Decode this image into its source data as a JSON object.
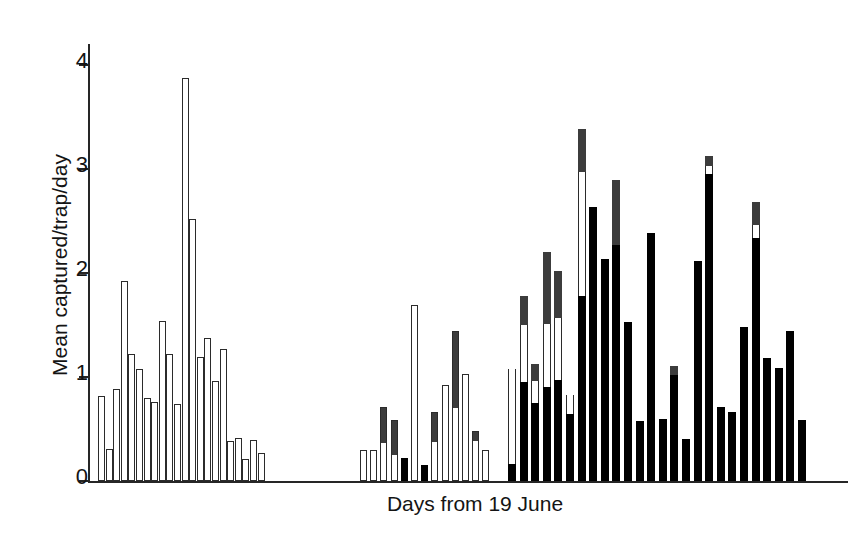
{
  "chart_data": {
    "type": "bar",
    "title": "",
    "subtitle": "",
    "xlabel": "Days from 19 June",
    "ylabel": "Mean captured/trap/day",
    "ylim": [
      0,
      4.2
    ],
    "yticks": [
      0,
      1,
      2,
      3,
      4
    ],
    "ytick_labels": [
      "0",
      "1",
      "2",
      "3",
      "4"
    ],
    "grid": false,
    "legend_position": "none",
    "stacked": true,
    "annotations": [],
    "segment_names": [
      "black",
      "white",
      "gray"
    ],
    "segment_colors": {
      "black": "#000000",
      "white": "#ffffff",
      "gray": "#3c3c3c",
      "outline": "#2b2b2b",
      "axis": "#262626",
      "text": "#141414"
    },
    "groups": [
      {
        "name": "group-1",
        "x_start_px": 98,
        "bar_width_px": 7,
        "bar_pitch_px": 7.6,
        "bars": [
          {
            "black": 0,
            "white": 0.82,
            "gray": 0
          },
          {
            "black": 0,
            "white": 0.31,
            "gray": 0
          },
          {
            "black": 0,
            "white": 0.88,
            "gray": 0
          },
          {
            "black": 0,
            "white": 1.92,
            "gray": 0
          },
          {
            "black": 0,
            "white": 1.22,
            "gray": 0
          },
          {
            "black": 0,
            "white": 1.08,
            "gray": 0
          },
          {
            "black": 0,
            "white": 0.8,
            "gray": 0
          },
          {
            "black": 0,
            "white": 0.76,
            "gray": 0
          },
          {
            "black": 0,
            "white": 1.54,
            "gray": 0
          },
          {
            "black": 0,
            "white": 1.22,
            "gray": 0
          },
          {
            "black": 0,
            "white": 0.74,
            "gray": 0
          },
          {
            "black": 0,
            "white": 3.87,
            "gray": 0
          },
          {
            "black": 0,
            "white": 2.52,
            "gray": 0
          },
          {
            "black": 0,
            "white": 1.19,
            "gray": 0
          },
          {
            "black": 0,
            "white": 1.37,
            "gray": 0
          },
          {
            "black": 0,
            "white": 0.96,
            "gray": 0
          },
          {
            "black": 0,
            "white": 1.27,
            "gray": 0
          },
          {
            "black": 0,
            "white": 0.38,
            "gray": 0
          },
          {
            "black": 0,
            "white": 0.41,
            "gray": 0
          },
          {
            "black": 0,
            "white": 0.21,
            "gray": 0
          },
          {
            "black": 0,
            "white": 0.39,
            "gray": 0
          },
          {
            "black": 0,
            "white": 0.27,
            "gray": 0
          }
        ]
      },
      {
        "name": "group-2",
        "x_start_px": 360,
        "bar_width_px": 7,
        "bar_pitch_px": 10.2,
        "bars": [
          {
            "black": 0,
            "white": 0.3,
            "gray": 0
          },
          {
            "black": 0,
            "white": 0.3,
            "gray": 0
          },
          {
            "black": 0,
            "white": 0.37,
            "gray": 0.34
          },
          {
            "black": 0,
            "white": 0.25,
            "gray": 0.34
          },
          {
            "black": 0.22,
            "white": 0,
            "gray": 0
          },
          {
            "black": 0,
            "white": 1.69,
            "gray": 0
          },
          {
            "black": 0.15,
            "white": 0,
            "gray": 0
          },
          {
            "black": 0,
            "white": 0.38,
            "gray": 0.28
          },
          {
            "black": 0,
            "white": 0.92,
            "gray": 0
          },
          {
            "black": 0,
            "white": 0.7,
            "gray": 0.74
          },
          {
            "black": 0,
            "white": 1.03,
            "gray": 0
          },
          {
            "black": 0,
            "white": 0.39,
            "gray": 0.09
          },
          {
            "black": 0,
            "white": 0.3,
            "gray": 0
          }
        ]
      },
      {
        "name": "group-3",
        "x_start_px": 508,
        "bar_width_px": 8,
        "bar_pitch_px": 11.6,
        "bars": [
          {
            "black": 0.16,
            "white": 0.92,
            "gray": 0
          },
          {
            "black": 0.95,
            "white": 0.55,
            "gray": 0.28
          },
          {
            "black": 0.75,
            "white": 0.21,
            "gray": 0.16
          },
          {
            "black": 0.9,
            "white": 0.61,
            "gray": 0.69
          },
          {
            "black": 0.97,
            "white": 0.6,
            "gray": 0.45
          },
          {
            "black": 0.64,
            "white": 0.19,
            "gray": 0
          },
          {
            "black": 1.78,
            "white": 1.19,
            "gray": 0.41
          },
          {
            "black": 2.63,
            "white": 0,
            "gray": 0
          },
          {
            "black": 2.13,
            "white": 0,
            "gray": 0
          },
          {
            "black": 2.27,
            "white": 0,
            "gray": 0.62
          },
          {
            "black": 1.53,
            "white": 0,
            "gray": 0
          },
          {
            "black": 0.58,
            "white": 0,
            "gray": 0
          },
          {
            "black": 2.38,
            "white": 0,
            "gray": 0
          },
          {
            "black": 0.6,
            "white": 0,
            "gray": 0
          },
          {
            "black": 1.02,
            "white": 0,
            "gray": 0.09
          },
          {
            "black": 0.4,
            "white": 0,
            "gray": 0
          },
          {
            "black": 2.11,
            "white": 0,
            "gray": 0
          },
          {
            "black": 2.95,
            "white": 0.08,
            "gray": 0.09
          },
          {
            "black": 0.71,
            "white": 0,
            "gray": 0
          },
          {
            "black": 0.66,
            "white": 0,
            "gray": 0
          },
          {
            "black": 1.48,
            "white": 0,
            "gray": 0
          },
          {
            "black": 2.34,
            "white": 0.12,
            "gray": 0.22
          },
          {
            "black": 1.18,
            "white": 0,
            "gray": 0
          },
          {
            "black": 1.09,
            "white": 0,
            "gray": 0
          },
          {
            "black": 1.44,
            "white": 0,
            "gray": 0
          },
          {
            "black": 0.59,
            "white": 0,
            "gray": 0
          }
        ]
      }
    ]
  }
}
